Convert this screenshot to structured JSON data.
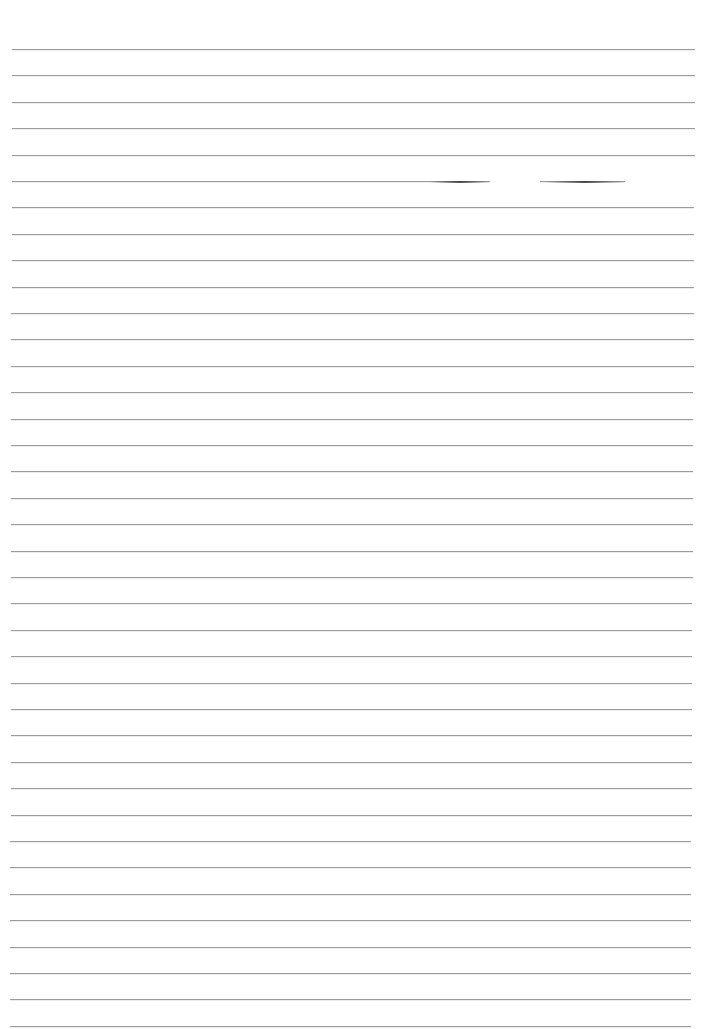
{
  "page": {
    "type": "blank lined paper",
    "background": "#ffffff",
    "line_color": "#8a8a8a",
    "line_count": 38,
    "first_line_y": 49,
    "line_spacing": 26.4,
    "line_left": 12,
    "line_right": 695,
    "broken_line": {
      "index": 5,
      "gaps": [
        {
          "from": 490,
          "to": 540
        },
        {
          "from": 625,
          "to": 705
        }
      ],
      "dark_segments": [
        {
          "from": 430,
          "to": 490
        },
        {
          "from": 545,
          "to": 625
        }
      ]
    }
  }
}
